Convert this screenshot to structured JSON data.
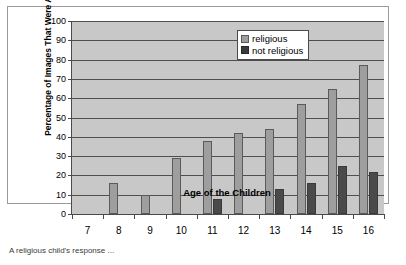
{
  "figure": {
    "caption_fragment": "A religious child's response ...",
    "legend": {
      "items": [
        {
          "label": "religious",
          "color": "#9e9e9e",
          "name": "legend-religious"
        },
        {
          "label": "not religious",
          "color": "#3a3a3a",
          "name": "legend-not-religious"
        }
      ]
    }
  },
  "chart_data": {
    "type": "bar",
    "title": "",
    "xlabel": "Age of the Children",
    "ylabel": "Percentage of Images That Were Abstract",
    "categories": [
      "7",
      "8",
      "9",
      "10",
      "11",
      "12",
      "13",
      "14",
      "15",
      "16"
    ],
    "ylim": [
      0,
      100
    ],
    "yticks": [
      0,
      10,
      20,
      30,
      40,
      50,
      60,
      70,
      80,
      90,
      100
    ],
    "grid": true,
    "legend_position": "top-right",
    "series": [
      {
        "name": "religious",
        "color": "#9e9e9e",
        "values": [
          0,
          16,
          10,
          29,
          38,
          42,
          44,
          57,
          65,
          77
        ]
      },
      {
        "name": "not religious",
        "color": "#3a3a3a",
        "values": [
          0,
          0,
          0,
          0,
          8,
          0,
          13,
          16,
          25,
          22
        ]
      }
    ]
  }
}
